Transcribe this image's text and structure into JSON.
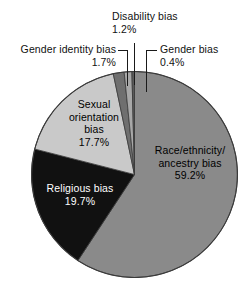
{
  "chart_data": {
    "type": "pie",
    "title": "",
    "subtitle": "",
    "xlabel": "",
    "ylabel": "",
    "legend_position": "none",
    "grid": false,
    "labels_show_percent": true,
    "categories": [
      "Race/ethnicity/ancestry bias",
      "Religious bias",
      "Sexual orientation bias",
      "Gender identity bias",
      "Disability bias",
      "Gender bias"
    ],
    "values": [
      59.2,
      19.7,
      17.7,
      1.7,
      1.2,
      0.4
    ],
    "units": "percent",
    "colors": [
      "#8a8a8a",
      "#111111",
      "#c9c9c9",
      "#6f6f6f",
      "#a8a8a8",
      "#5a5a5a"
    ],
    "start_angle_deg": -90,
    "direction": "clockwise",
    "slices": [
      {
        "name": "Race/ethnicity/ancestry bias",
        "label_line1": "Race/ethnicity/",
        "label_line2": "ancestry bias",
        "percent_text": "59.2%",
        "value": 59.2,
        "color": "#8a8a8a",
        "label_placement": "inside",
        "text_color": "#000000"
      },
      {
        "name": "Religious bias",
        "label_line1": "Religious bias",
        "label_line2": "",
        "percent_text": "19.7%",
        "value": 19.7,
        "color": "#111111",
        "label_placement": "inside",
        "text_color": "#ffffff"
      },
      {
        "name": "Sexual orientation bias",
        "label_line1": "Sexual",
        "label_line2": "orientation",
        "label_line3": "bias",
        "percent_text": "17.7%",
        "value": 17.7,
        "color": "#c9c9c9",
        "label_placement": "inside",
        "text_color": "#000000"
      },
      {
        "name": "Gender identity bias",
        "label_line1": "Gender identity bias",
        "label_line2": "",
        "percent_text": "1.7%",
        "value": 1.7,
        "color": "#6f6f6f",
        "label_placement": "outside-left",
        "text_color": "#111111"
      },
      {
        "name": "Disability bias",
        "label_line1": "Disability bias",
        "label_line2": "",
        "percent_text": "1.2%",
        "value": 1.2,
        "color": "#a8a8a8",
        "label_placement": "outside-top",
        "text_color": "#111111"
      },
      {
        "name": "Gender bias",
        "label_line1": "Gender bias",
        "label_line2": "",
        "percent_text": "0.4%",
        "value": 0.4,
        "color": "#5a5a5a",
        "label_placement": "outside-right",
        "text_color": "#111111"
      }
    ]
  },
  "labels": {
    "disability": {
      "name": "Disability bias",
      "percent": "1.2%"
    },
    "gender_identity": {
      "name": "Gender identity bias",
      "percent": "1.7%"
    },
    "gender": {
      "name": "Gender bias",
      "percent": "0.4%"
    },
    "sexual_orientation": {
      "line1": "Sexual",
      "line2": "orientation",
      "line3": "bias",
      "percent": "17.7%"
    },
    "race": {
      "line1": "Race/ethnicity/",
      "line2": "ancestry bias",
      "percent": "59.2%"
    },
    "religious": {
      "name": "Religious bias",
      "percent": "19.7%"
    }
  },
  "palette": {
    "race": "#8a8a8a",
    "religious": "#111111",
    "sexual_orientation": "#c9c9c9",
    "gender_identity": "#6f6f6f",
    "disability": "#a8a8a8",
    "gender": "#5a5a5a",
    "outline": "#3a3a3a",
    "background": "#ffffff"
  }
}
